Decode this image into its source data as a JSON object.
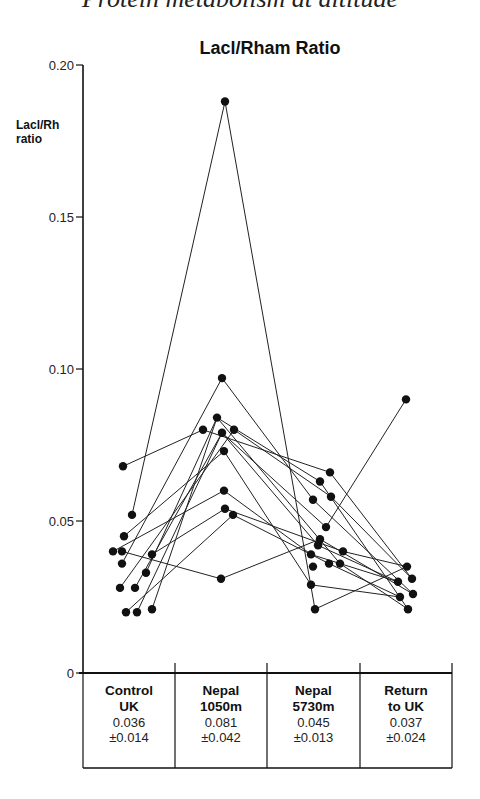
{
  "running_head": "Protein metabolism at altitude",
  "chart_data": {
    "type": "line",
    "title": "Lacl/Rham Ratio",
    "ylabel": "Lacl/Rh ratio",
    "ylabel_lines": [
      "Lacl/Rh",
      "ratio"
    ],
    "xlabel": "",
    "ylim": [
      0,
      0.2
    ],
    "yticks": [
      0,
      0.05,
      0.1,
      0.15,
      0.2
    ],
    "ytick_labels": [
      "0",
      "0.05",
      "0.10",
      "0.15",
      "0.20"
    ],
    "grid": false,
    "legend": null,
    "categories": [
      "Control UK",
      "Nepal 1050m",
      "Nepal 5730m",
      "Return to UK"
    ],
    "category_labels": [
      [
        "Control",
        "UK"
      ],
      [
        "Nepal",
        "1050m"
      ],
      [
        "Nepal",
        "5730m"
      ],
      [
        "Return",
        "to UK"
      ]
    ],
    "summary": [
      {
        "mean": "0.036",
        "sd": "±0.014"
      },
      {
        "mean": "0.081",
        "sd": "±0.042"
      },
      {
        "mean": "0.045",
        "sd": "±0.013"
      },
      {
        "mean": "0.037",
        "sd": "±0.024"
      }
    ],
    "note": "Individual subjects plotted as connected points; values estimated from axis.",
    "points": [
      {
        "cat": 0,
        "x": 123,
        "value": 0.068
      },
      {
        "cat": 0,
        "x": 132,
        "value": 0.052
      },
      {
        "cat": 0,
        "x": 124,
        "value": 0.045
      },
      {
        "cat": 0,
        "x": 113,
        "value": 0.04
      },
      {
        "cat": 0,
        "x": 122,
        "value": 0.04
      },
      {
        "cat": 0,
        "x": 152,
        "value": 0.039
      },
      {
        "cat": 0,
        "x": 122,
        "value": 0.036
      },
      {
        "cat": 0,
        "x": 146,
        "value": 0.033
      },
      {
        "cat": 0,
        "x": 120,
        "value": 0.028
      },
      {
        "cat": 0,
        "x": 135,
        "value": 0.028
      },
      {
        "cat": 0,
        "x": 126,
        "value": 0.02
      },
      {
        "cat": 0,
        "x": 137,
        "value": 0.02
      },
      {
        "cat": 0,
        "x": 152,
        "value": 0.021
      },
      {
        "cat": 1,
        "x": 225,
        "value": 0.188
      },
      {
        "cat": 1,
        "x": 222,
        "value": 0.097
      },
      {
        "cat": 1,
        "x": 217,
        "value": 0.084
      },
      {
        "cat": 1,
        "x": 203,
        "value": 0.08
      },
      {
        "cat": 1,
        "x": 222,
        "value": 0.079
      },
      {
        "cat": 1,
        "x": 234,
        "value": 0.08
      },
      {
        "cat": 1,
        "x": 224,
        "value": 0.073
      },
      {
        "cat": 1,
        "x": 224,
        "value": 0.06
      },
      {
        "cat": 1,
        "x": 225,
        "value": 0.054
      },
      {
        "cat": 1,
        "x": 233,
        "value": 0.052
      },
      {
        "cat": 1,
        "x": 221,
        "value": 0.031
      },
      {
        "cat": 2,
        "x": 330,
        "value": 0.066
      },
      {
        "cat": 2,
        "x": 320,
        "value": 0.063
      },
      {
        "cat": 2,
        "x": 331,
        "value": 0.058
      },
      {
        "cat": 2,
        "x": 313,
        "value": 0.057
      },
      {
        "cat": 2,
        "x": 326,
        "value": 0.048
      },
      {
        "cat": 2,
        "x": 320,
        "value": 0.044
      },
      {
        "cat": 2,
        "x": 318,
        "value": 0.042
      },
      {
        "cat": 2,
        "x": 311,
        "value": 0.039
      },
      {
        "cat": 2,
        "x": 343,
        "value": 0.04
      },
      {
        "cat": 2,
        "x": 329,
        "value": 0.036
      },
      {
        "cat": 2,
        "x": 340,
        "value": 0.036
      },
      {
        "cat": 2,
        "x": 313,
        "value": 0.035
      },
      {
        "cat": 2,
        "x": 311,
        "value": 0.029
      },
      {
        "cat": 2,
        "x": 315,
        "value": 0.021
      },
      {
        "cat": 3,
        "x": 406,
        "value": 0.09
      },
      {
        "cat": 3,
        "x": 407,
        "value": 0.035
      },
      {
        "cat": 3,
        "x": 412,
        "value": 0.031
      },
      {
        "cat": 3,
        "x": 398,
        "value": 0.03
      },
      {
        "cat": 3,
        "x": 413,
        "value": 0.026
      },
      {
        "cat": 3,
        "x": 400,
        "value": 0.025
      },
      {
        "cat": 3,
        "x": 408,
        "value": 0.021
      }
    ],
    "series": [
      {
        "name": "subject-1",
        "x": [
          132,
          225,
          315,
          407
        ],
        "values": [
          0.052,
          0.188,
          0.021,
          0.035
        ]
      },
      {
        "name": "subject-2",
        "x": [
          123,
          203,
          330,
          412
        ],
        "values": [
          0.068,
          0.08,
          0.066,
          0.031
        ]
      },
      {
        "name": "subject-3",
        "x": [
          113,
          224,
          311,
          398
        ],
        "values": [
          0.04,
          0.06,
          0.039,
          0.03
        ]
      },
      {
        "name": "subject-4",
        "x": [
          124,
          224,
          311,
          400
        ],
        "values": [
          0.045,
          0.073,
          0.029,
          0.025
        ]
      },
      {
        "name": "subject-5",
        "x": [
          122,
          222,
          313,
          413
        ],
        "values": [
          0.036,
          0.097,
          0.057,
          0.026
        ]
      },
      {
        "name": "subject-6",
        "x": [
          146,
          217,
          320,
          408
        ],
        "values": [
          0.033,
          0.084,
          0.063,
          0.021
        ]
      },
      {
        "name": "subject-7",
        "x": [
          120,
          234,
          331,
          412
        ],
        "values": [
          0.028,
          0.08,
          0.058,
          0.031
        ]
      },
      {
        "name": "subject-8",
        "x": [
          137,
          222,
          326,
          406
        ],
        "values": [
          0.02,
          0.079,
          0.048,
          0.09
        ]
      },
      {
        "name": "subject-9",
        "x": [
          152,
          225,
          343,
          407
        ],
        "values": [
          0.039,
          0.054,
          0.04,
          0.035
        ]
      },
      {
        "name": "subject-10",
        "x": [
          126,
          233,
          329,
          400
        ],
        "values": [
          0.02,
          0.052,
          0.036,
          0.025
        ]
      },
      {
        "name": "subject-11",
        "x": [
          122,
          221,
          320,
          413
        ],
        "values": [
          0.04,
          0.031,
          0.044,
          0.026
        ]
      },
      {
        "name": "subject-12",
        "x": [
          135,
          222,
          318,
          398
        ],
        "values": [
          0.028,
          0.079,
          0.042,
          0.03
        ]
      },
      {
        "name": "subject-13",
        "x": [
          152,
          217,
          340,
          408
        ],
        "values": [
          0.021,
          0.084,
          0.036,
          0.021
        ]
      }
    ]
  }
}
